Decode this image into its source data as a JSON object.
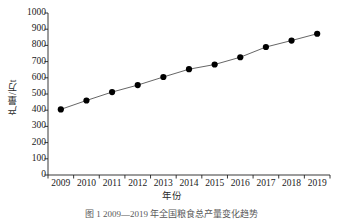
{
  "chart_data": {
    "type": "line",
    "title": "",
    "xlabel": "年份",
    "ylabel": "产量/万t",
    "categories": [
      "2009",
      "2010",
      "2011",
      "2012",
      "2013",
      "2014",
      "2015",
      "2016",
      "2017",
      "2018",
      "2019"
    ],
    "x": [
      2009,
      2010,
      2011,
      2012,
      2013,
      2014,
      2015,
      2016,
      2017,
      2018,
      2019
    ],
    "values": [
      405,
      460,
      512,
      555,
      605,
      653,
      682,
      727,
      790,
      830,
      872
    ],
    "series": [
      {
        "name": "产量",
        "values": [
          405,
          460,
          512,
          555,
          605,
          653,
          682,
          727,
          790,
          830,
          872
        ]
      }
    ],
    "ylim": [
      0,
      1000
    ],
    "y_ticks": [
      0,
      100,
      200,
      300,
      400,
      500,
      600,
      700,
      800,
      900,
      1000
    ],
    "y_tick_labels": [
      "0",
      "100",
      "200",
      "300",
      "400",
      "500",
      "600",
      "700",
      "800",
      "900",
      "1000"
    ],
    "grid": false,
    "legend": false,
    "legend_position": "none",
    "marker": "filled-circle",
    "marker_color": "#000000",
    "line_color": "#555555"
  },
  "caption": {
    "text": "图 1  2009—2019 年全国粮食总产量变化趋势"
  }
}
